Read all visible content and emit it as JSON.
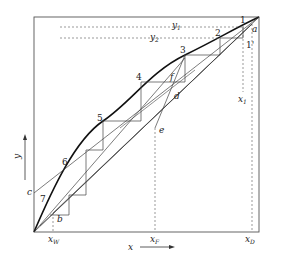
{
  "diagram": {
    "axes": {
      "x_label": "x",
      "y_label": "y",
      "x_marks": [
        {
          "id": "xW",
          "base": "x",
          "sub": "W"
        },
        {
          "id": "xF",
          "base": "x",
          "sub": "F"
        },
        {
          "id": "xD",
          "base": "x",
          "sub": "D"
        },
        {
          "id": "x1",
          "base": "x",
          "sub": "1"
        }
      ],
      "y_marks": [
        {
          "id": "y1",
          "base": "y",
          "sub": "1"
        },
        {
          "id": "y2",
          "base": "y",
          "sub": "2"
        }
      ]
    },
    "stage_labels": [
      "1",
      "2",
      "3",
      "4",
      "5",
      "6",
      "7"
    ],
    "point_labels": {
      "a": "a",
      "b": "b",
      "c": "c",
      "d": "d",
      "e": "e",
      "f": "f",
      "one_prime": "1'"
    },
    "colors": {
      "line": "#333333",
      "curve": "#111111",
      "dashed": "#555555"
    }
  }
}
